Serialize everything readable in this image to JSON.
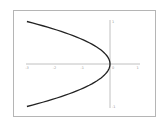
{
  "chart_data": {
    "type": "line",
    "title": "",
    "xlabel": "",
    "ylabel": "",
    "xlim": [
      -3,
      1
    ],
    "ylim": [
      -1,
      1
    ],
    "grid": false,
    "legend": null,
    "x_ticks": [
      "-3",
      "-2",
      "-1",
      "0",
      "1"
    ],
    "y_ticks": [
      "1",
      "-1"
    ],
    "series": [
      {
        "name": "x = -3y^2",
        "x": [
          -3,
          -1.92,
          -1.08,
          -0.48,
          -0.12,
          0,
          -0.12,
          -0.48,
          -1.08,
          -1.92,
          -3
        ],
        "y": [
          1,
          0.8,
          0.6,
          0.4,
          0.2,
          0,
          -0.2,
          -0.4,
          -0.6,
          -0.8,
          -1
        ]
      }
    ]
  },
  "colors": {
    "curve": "#222222",
    "axis": "#b0b0b0",
    "frame": "#b5b5b5",
    "tick_label": "#999999"
  }
}
